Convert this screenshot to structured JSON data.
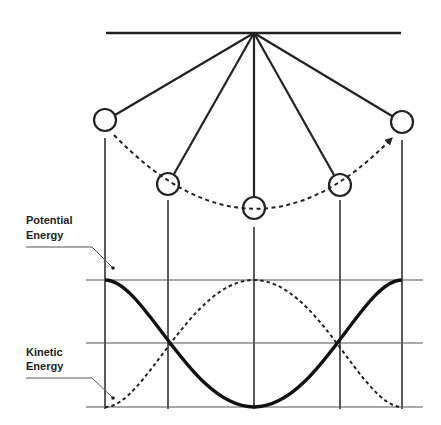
{
  "labels": {
    "potential_line1": "Potential",
    "potential_line2": "Energy",
    "kinetic_line1": "Kinetic",
    "kinetic_line2": "Energy"
  },
  "colors": {
    "ink": "#222222",
    "grid": "#444444",
    "background": "#ffffff"
  },
  "pendulum": {
    "pivot": [
      254,
      33
    ],
    "support_bar": {
      "x1": 106,
      "x2": 401,
      "y": 33
    },
    "bob_radius": 11,
    "positions": [
      {
        "name": "left-extreme",
        "x": 105,
        "y": 120
      },
      {
        "name": "left-mid",
        "x": 168,
        "y": 184
      },
      {
        "name": "bottom",
        "x": 254,
        "y": 208
      },
      {
        "name": "right-mid",
        "x": 340,
        "y": 185
      },
      {
        "name": "right-extreme",
        "x": 402,
        "y": 122
      }
    ],
    "swing_path": "dashed arc with arrow toward right extreme"
  },
  "energy_graph": {
    "levels": {
      "max_y": 280,
      "half_y": 343,
      "zero_y": 407
    },
    "x_range": [
      86,
      423
    ],
    "phase_columns_x": [
      105,
      168,
      254,
      340,
      402
    ],
    "potential_energy": {
      "style": "solid-thick",
      "values_at_columns": [
        1.0,
        0.5,
        0.0,
        0.5,
        1.0
      ]
    },
    "kinetic_energy": {
      "style": "dashed",
      "values_at_columns": [
        0.0,
        0.5,
        1.0,
        0.5,
        0.0
      ]
    }
  }
}
